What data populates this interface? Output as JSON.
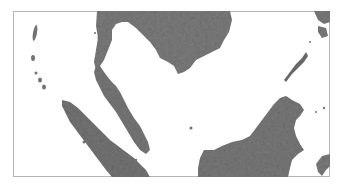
{
  "map": {
    "type": "shaded-relief",
    "region": "Southeast Asia",
    "background_color": "#ffffff",
    "land_color": "#7a7a7a",
    "land_dark_color": "#5e5e5e",
    "land_light_color": "#969696",
    "frame_color": "#b4b4b4",
    "frame": {
      "x": 13,
      "y": 11,
      "width": 317,
      "height": 166
    },
    "landmasses": [
      {
        "id": "indochina",
        "name": "Indochina (Thailand, Cambodia, Vietnam)"
      },
      {
        "id": "malay-peninsula",
        "name": "Malay Peninsula"
      },
      {
        "id": "sumatra",
        "name": "Sumatra"
      },
      {
        "id": "borneo",
        "name": "Borneo"
      },
      {
        "id": "palawan",
        "name": "Palawan"
      },
      {
        "id": "philippines",
        "name": "Philippine islands"
      },
      {
        "id": "andaman-nicobar",
        "name": "Andaman and Nicobar Islands"
      },
      {
        "id": "sulawesi",
        "name": "Sulawesi (partial)"
      }
    ]
  }
}
